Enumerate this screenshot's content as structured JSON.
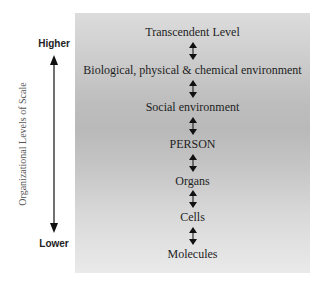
{
  "axis": {
    "title": "Organizational Levels of Scale",
    "top_label": "Higher",
    "bottom_label": "Lower"
  },
  "levels": [
    {
      "label": "Transcendent Level"
    },
    {
      "label": "Biological, physical & chemical environment"
    },
    {
      "label": "Social environment"
    },
    {
      "label": "PERSON"
    },
    {
      "label": "Organs"
    },
    {
      "label": "Cells"
    },
    {
      "label": "Molecules"
    }
  ],
  "connector_icon": "double-arrow-vertical",
  "colors": {
    "text": "#1e1e1e",
    "panel_top": "#dcdcdc",
    "panel_mid": "#b9b9b9",
    "panel_bottom": "#eaeaea"
  }
}
